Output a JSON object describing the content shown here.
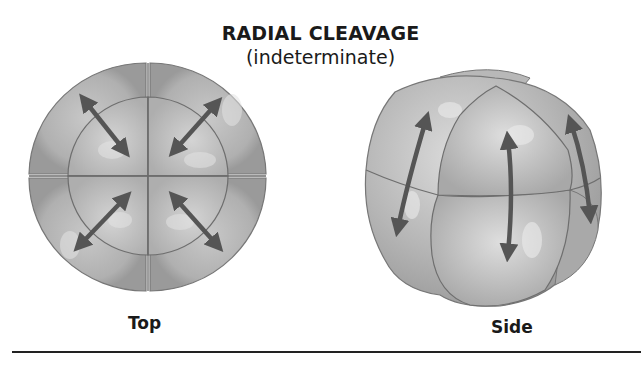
{
  "title": "RADIAL CLEAVAGE",
  "subtitle": "(indeterminate)",
  "views": [
    {
      "label": "Top",
      "description": "8-cell embryo viewed from top; four quadrants with diagonal double-headed arrows"
    },
    {
      "label": "Side",
      "description": "8-cell embryo viewed from side; two tiers of blastomeres with vertical double-headed arrows"
    }
  ],
  "colors": {
    "cell_fill": "#a9a9a9",
    "cell_highlight": "#d6d6d6",
    "cell_outline": "#6e6e6e",
    "arrow": "#555555",
    "text": "#1a1a1a"
  }
}
